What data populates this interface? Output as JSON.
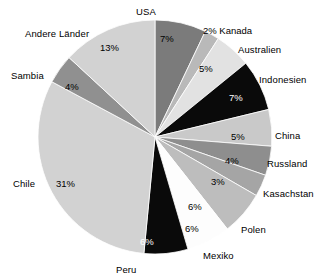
{
  "chart_data": {
    "type": "pie",
    "title": "",
    "subtitle": "",
    "xlabel": "",
    "ylabel": "",
    "legend_position": "none",
    "grid": false,
    "start_angle_deg": 0,
    "direction": "clockwise",
    "unit": "%",
    "categories": [
      "USA",
      "Kanada",
      "Australien",
      "Indonesien",
      "China",
      "Russland",
      "Kasachstan",
      "Polen",
      "Mexiko",
      "Peru",
      "Chile",
      "Sambia",
      "Andere Länder"
    ],
    "values": [
      7,
      2,
      5,
      7,
      5,
      4,
      3,
      6,
      6,
      6,
      31,
      4,
      13
    ],
    "total": 99,
    "slices": [
      {
        "label": "USA",
        "value": 7,
        "value_text": "7%",
        "color": "#7b7b7b",
        "label_on_dark": false,
        "pct_on_dark": false,
        "pct_inside": true,
        "label_x": 136,
        "label_y": 6,
        "pct_x": 160,
        "pct_y": 33
      },
      {
        "label": "Kanada",
        "value": 2,
        "value_text": "2%",
        "color": "#b9b9b9",
        "label_on_dark": false,
        "pct_on_dark": false,
        "pct_inside": false,
        "label_x": 203,
        "label_y": 25,
        "pct_x": 203,
        "pct_y": 25,
        "combo_text": "2% Kanada"
      },
      {
        "label": "Australien",
        "value": 5,
        "value_text": "5%",
        "color": "#e2e2e2",
        "label_on_dark": false,
        "pct_on_dark": false,
        "pct_inside": true,
        "label_x": 238,
        "label_y": 44,
        "pct_x": 199,
        "pct_y": 63
      },
      {
        "label": "Indonesien",
        "value": 7,
        "value_text": "7%",
        "color": "#0a0a0a",
        "label_on_dark": false,
        "pct_on_dark": true,
        "pct_inside": true,
        "label_x": 259,
        "label_y": 74,
        "pct_x": 229,
        "pct_y": 92
      },
      {
        "label": "China",
        "value": 5,
        "value_text": "5%",
        "color": "#c9c9c9",
        "label_on_dark": false,
        "pct_on_dark": false,
        "pct_inside": true,
        "label_x": 275,
        "label_y": 130,
        "pct_x": 231,
        "pct_y": 131
      },
      {
        "label": "Russland",
        "value": 4,
        "value_text": "4%",
        "color": "#8e8e8e",
        "label_on_dark": false,
        "pct_on_dark": false,
        "pct_inside": true,
        "label_x": 267,
        "label_y": 158,
        "pct_x": 225,
        "pct_y": 155
      },
      {
        "label": "Kasachstan",
        "value": 3,
        "value_text": "3%",
        "color": "#a5a5a5",
        "label_on_dark": false,
        "pct_on_dark": false,
        "pct_inside": true,
        "label_x": 263,
        "label_y": 188,
        "pct_x": 211,
        "pct_y": 176
      },
      {
        "label": "Polen",
        "value": 6,
        "value_text": "6%",
        "color": "#bdbdbd",
        "label_on_dark": false,
        "pct_on_dark": false,
        "pct_inside": true,
        "label_x": 241,
        "label_y": 224,
        "pct_x": 188,
        "pct_y": 201
      },
      {
        "label": "Mexiko",
        "value": 6,
        "value_text": "6%",
        "color": "#fdfdfd",
        "label_on_dark": false,
        "pct_on_dark": false,
        "pct_inside": false,
        "label_x": 203,
        "label_y": 250,
        "pct_x": 185,
        "pct_y": 223
      },
      {
        "label": "Peru",
        "value": 6,
        "value_text": "6%",
        "color": "#0a0a0a",
        "label_on_dark": false,
        "pct_on_dark": true,
        "pct_inside": true,
        "label_x": 116,
        "label_y": 264,
        "pct_x": 140,
        "pct_y": 236
      },
      {
        "label": "Chile",
        "value": 31,
        "value_text": "31%",
        "color": "#d2d2d2",
        "label_on_dark": false,
        "pct_on_dark": false,
        "pct_inside": true,
        "label_x": 13,
        "label_y": 178,
        "pct_x": 56,
        "pct_y": 178
      },
      {
        "label": "Sambia",
        "value": 4,
        "value_text": "4%",
        "color": "#909090",
        "label_on_dark": false,
        "pct_on_dark": false,
        "pct_inside": true,
        "label_x": 11,
        "label_y": 70,
        "pct_x": 65,
        "pct_y": 81
      },
      {
        "label": "Andere Länder",
        "value": 13,
        "value_text": "13%",
        "color": "#d2d2d2",
        "label_on_dark": false,
        "pct_on_dark": false,
        "pct_inside": true,
        "label_x": 25,
        "label_y": 28,
        "pct_x": 100,
        "pct_y": 42
      }
    ],
    "geometry": {
      "center_x": 155,
      "center_y": 137,
      "radius": 117
    },
    "colors": {
      "background": "#ffffff",
      "text": "#000000",
      "text_on_dark": "#ffffff"
    }
  }
}
